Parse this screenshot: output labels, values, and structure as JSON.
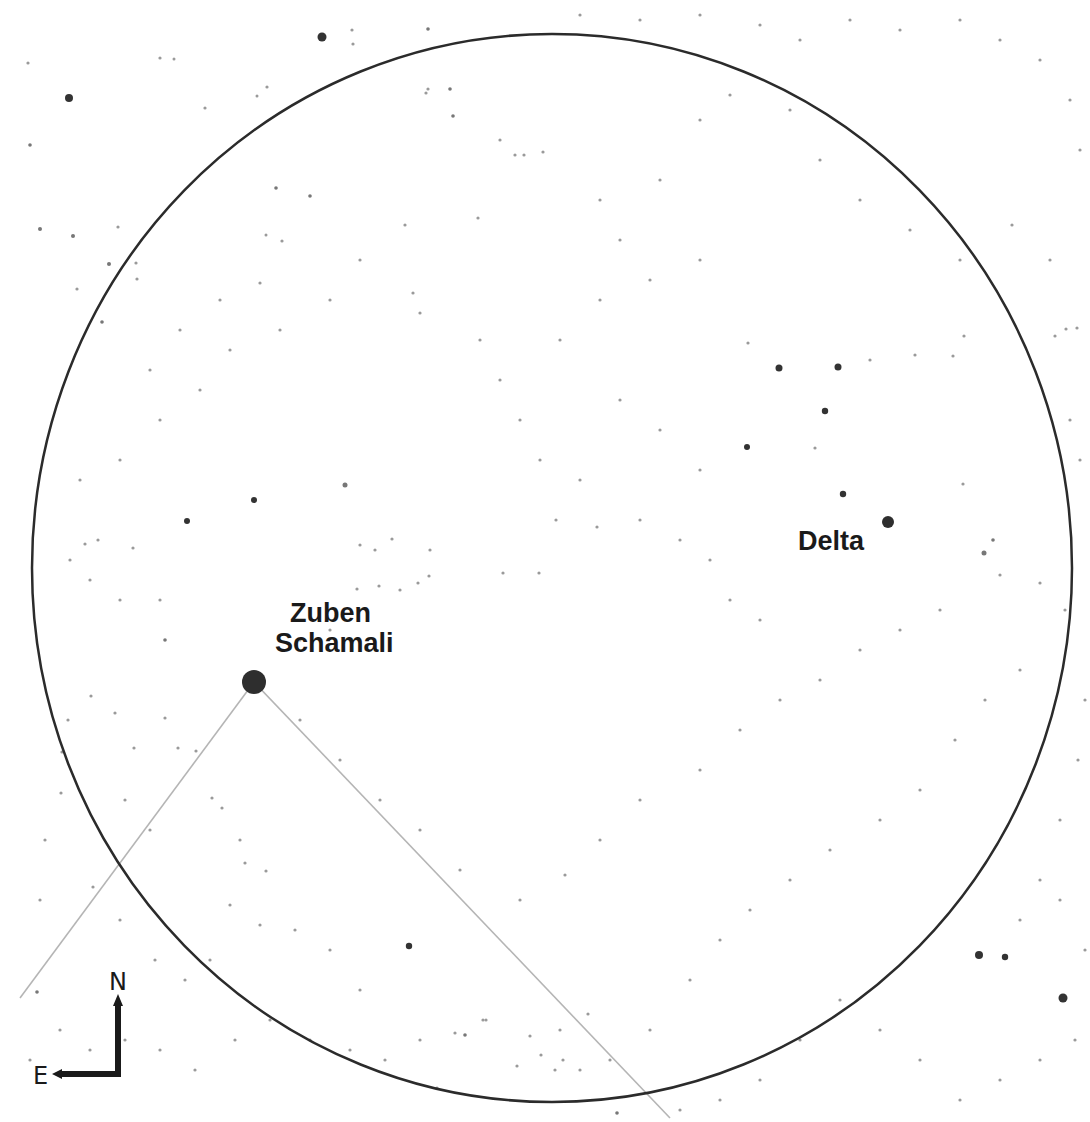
{
  "chart": {
    "background": "#ffffff",
    "field_of_view": {
      "cx": 552,
      "cy": 568,
      "rx": 520,
      "ry": 534,
      "stroke": "#2b2b2b",
      "stroke_width": 2.5
    },
    "asterism_lines": [
      {
        "x1": 254,
        "y1": 682,
        "x2": 20,
        "y2": 998
      },
      {
        "x1": 254,
        "y1": 682,
        "x2": 670,
        "y2": 1118
      }
    ],
    "line_color": "#b5b5b5"
  },
  "labels": {
    "zuben_line1": "Zuben",
    "zuben_line2": "Schamali",
    "delta": "Delta"
  },
  "compass": {
    "north": "N",
    "east": "E"
  },
  "named_stars": [
    {
      "name": "Zuben Schamali",
      "x": 254,
      "y": 682,
      "r": 12
    },
    {
      "name": "Delta",
      "x": 888,
      "y": 522,
      "r": 6
    }
  ],
  "stars": [
    [
      322,
      37,
      4.5
    ],
    [
      69,
      98,
      4
    ],
    [
      779,
      368,
      3.5
    ],
    [
      838,
      367,
      3.5
    ],
    [
      825,
      411,
      3.2
    ],
    [
      747,
      447,
      3
    ],
    [
      843,
      494,
      3.2
    ],
    [
      984,
      553,
      2.5
    ],
    [
      979,
      955,
      4
    ],
    [
      1005,
      957,
      3.2
    ],
    [
      1063,
      998,
      4.5
    ],
    [
      187,
      521,
      3
    ],
    [
      254,
      500,
      3
    ],
    [
      345,
      485,
      2.5
    ],
    [
      409,
      946,
      3.2
    ],
    [
      40,
      229,
      2
    ],
    [
      73,
      236,
      2
    ],
    [
      109,
      264,
      2
    ],
    [
      102,
      322,
      1.8
    ],
    [
      30,
      145,
      1.8
    ],
    [
      28,
      63,
      1.6
    ],
    [
      160,
      58,
      1.6
    ],
    [
      353,
      44,
      1.6
    ],
    [
      426,
      93,
      1.6
    ],
    [
      174,
      59,
      1.5
    ],
    [
      267,
      87,
      1.6
    ],
    [
      205,
      108,
      1.6
    ],
    [
      257,
      96,
      1.5
    ],
    [
      450,
      89,
      1.8
    ],
    [
      428,
      29,
      1.8
    ],
    [
      352,
      30,
      1.6
    ],
    [
      478,
      218,
      1.6
    ],
    [
      276,
      188,
      1.8
    ],
    [
      310,
      196,
      1.8
    ],
    [
      266,
      235,
      1.5
    ],
    [
      282,
      241,
      1.6
    ],
    [
      405,
      225,
      1.6
    ],
    [
      413,
      293,
      1.6
    ],
    [
      524,
      155,
      1.6
    ],
    [
      453,
      116,
      1.8
    ],
    [
      428,
      89,
      1.6
    ],
    [
      543,
      152,
      1.6
    ],
    [
      500,
      140,
      1.6
    ],
    [
      515,
      155,
      1.6
    ],
    [
      118,
      227,
      1.6
    ],
    [
      77,
      289,
      1.6
    ],
    [
      137,
      279,
      1.6
    ],
    [
      136,
      263,
      1.6
    ],
    [
      260,
      283,
      1.6
    ],
    [
      420,
      313,
      1.6
    ],
    [
      600,
      200,
      1.6
    ],
    [
      620,
      240,
      1.6
    ],
    [
      660,
      180,
      1.6
    ],
    [
      700,
      120,
      1.6
    ],
    [
      730,
      95,
      1.6
    ],
    [
      790,
      110,
      1.6
    ],
    [
      820,
      160,
      1.6
    ],
    [
      860,
      200,
      1.6
    ],
    [
      910,
      230,
      1.6
    ],
    [
      960,
      260,
      1.6
    ],
    [
      1012,
      225,
      1.6
    ],
    [
      1050,
      260,
      1.6
    ],
    [
      1066,
      329,
      1.6
    ],
    [
      1055,
      336,
      1.6
    ],
    [
      1077,
      328,
      1.6
    ],
    [
      964,
      336,
      1.6
    ],
    [
      953,
      356,
      1.6
    ],
    [
      915,
      355,
      1.6
    ],
    [
      748,
      343,
      1.6
    ],
    [
      870,
      360,
      1.6
    ],
    [
      815,
      448,
      1.6
    ],
    [
      963,
      484,
      1.6
    ],
    [
      993,
      540,
      1.8
    ],
    [
      1000,
      575,
      1.6
    ],
    [
      1040,
      583,
      1.6
    ],
    [
      1065,
      610,
      1.6
    ],
    [
      1020,
      670,
      1.6
    ],
    [
      985,
      700,
      1.6
    ],
    [
      955,
      740,
      1.6
    ],
    [
      920,
      790,
      1.6
    ],
    [
      880,
      820,
      1.6
    ],
    [
      830,
      850,
      1.6
    ],
    [
      790,
      880,
      1.6
    ],
    [
      750,
      910,
      1.6
    ],
    [
      720,
      940,
      1.6
    ],
    [
      690,
      980,
      1.6
    ],
    [
      650,
      1030,
      1.6
    ],
    [
      610,
      1060,
      1.6
    ],
    [
      580,
      1070,
      1.6
    ],
    [
      560,
      1030,
      1.6
    ],
    [
      530,
      1036,
      1.6
    ],
    [
      486,
      1020,
      1.6
    ],
    [
      455,
      1033,
      1.6
    ],
    [
      420,
      1040,
      1.6
    ],
    [
      385,
      1060,
      1.6
    ],
    [
      350,
      1050,
      1.6
    ],
    [
      310,
      1040,
      1.6
    ],
    [
      270,
      1020,
      1.6
    ],
    [
      235,
      1040,
      1.6
    ],
    [
      195,
      1070,
      1.6
    ],
    [
      160,
      1050,
      1.6
    ],
    [
      125,
      1040,
      1.6
    ],
    [
      90,
      1050,
      1.6
    ],
    [
      60,
      1030,
      1.6
    ],
    [
      37,
      992,
      1.8
    ],
    [
      30,
      1060,
      1.6
    ],
    [
      40,
      900,
      1.6
    ],
    [
      45,
      840,
      1.6
    ],
    [
      61,
      793,
      1.6
    ],
    [
      62,
      752,
      1.6
    ],
    [
      68,
      720,
      1.6
    ],
    [
      91,
      696,
      1.6
    ],
    [
      115,
      713,
      1.6
    ],
    [
      134,
      748,
      1.6
    ],
    [
      165,
      718,
      1.6
    ],
    [
      178,
      748,
      1.6
    ],
    [
      196,
      751,
      1.6
    ],
    [
      212,
      798,
      1.6
    ],
    [
      222,
      808,
      1.6
    ],
    [
      245,
      863,
      1.6
    ],
    [
      266,
      871,
      1.6
    ],
    [
      240,
      840,
      1.6
    ],
    [
      150,
      830,
      1.6
    ],
    [
      125,
      800,
      1.6
    ],
    [
      93,
      887,
      1.6
    ],
    [
      120,
      920,
      1.6
    ],
    [
      155,
      960,
      1.6
    ],
    [
      185,
      980,
      1.6
    ],
    [
      210,
      960,
      1.6
    ],
    [
      230,
      905,
      1.6
    ],
    [
      260,
      925,
      1.6
    ],
    [
      295,
      930,
      1.6
    ],
    [
      330,
      950,
      1.6
    ],
    [
      360,
      990,
      1.6
    ],
    [
      300,
      720,
      1.6
    ],
    [
      340,
      760,
      1.6
    ],
    [
      380,
      800,
      1.6
    ],
    [
      420,
      830,
      1.6
    ],
    [
      460,
      870,
      1.6
    ],
    [
      520,
      900,
      1.6
    ],
    [
      565,
      875,
      1.6
    ],
    [
      600,
      840,
      1.6
    ],
    [
      640,
      800,
      1.6
    ],
    [
      700,
      770,
      1.6
    ],
    [
      740,
      730,
      1.6
    ],
    [
      780,
      700,
      1.6
    ],
    [
      820,
      680,
      1.6
    ],
    [
      860,
      650,
      1.6
    ],
    [
      900,
      630,
      1.6
    ],
    [
      940,
      610,
      1.6
    ],
    [
      300,
      640,
      1.6
    ],
    [
      330,
      630,
      1.6
    ],
    [
      360,
      610,
      1.6
    ],
    [
      400,
      590,
      1.6
    ],
    [
      430,
      550,
      1.6
    ],
    [
      360,
      545,
      1.6
    ],
    [
      375,
      550,
      1.6
    ],
    [
      392,
      539,
      1.6
    ],
    [
      379,
      586,
      1.6
    ],
    [
      429,
      576,
      1.6
    ],
    [
      357,
      589,
      1.6
    ],
    [
      418,
      583,
      1.6
    ],
    [
      503,
      573,
      1.6
    ],
    [
      539,
      573,
      1.6
    ],
    [
      556,
      520,
      1.6
    ],
    [
      597,
      527,
      1.6
    ],
    [
      640,
      520,
      1.6
    ],
    [
      680,
      540,
      1.6
    ],
    [
      710,
      560,
      1.6
    ],
    [
      730,
      600,
      1.6
    ],
    [
      760,
      620,
      1.6
    ],
    [
      540,
      460,
      1.6
    ],
    [
      520,
      420,
      1.6
    ],
    [
      500,
      380,
      1.6
    ],
    [
      480,
      340,
      1.6
    ],
    [
      560,
      340,
      1.6
    ],
    [
      600,
      300,
      1.6
    ],
    [
      650,
      280,
      1.6
    ],
    [
      700,
      260,
      1.6
    ],
    [
      620,
      400,
      1.6
    ],
    [
      660,
      430,
      1.6
    ],
    [
      700,
      470,
      1.6
    ],
    [
      580,
      480,
      1.6
    ],
    [
      165,
      640,
      1.8
    ],
    [
      160,
      600,
      1.6
    ],
    [
      120,
      600,
      1.6
    ],
    [
      90,
      580,
      1.6
    ],
    [
      70,
      560,
      1.6
    ],
    [
      80,
      480,
      1.6
    ],
    [
      120,
      460,
      1.6
    ],
    [
      160,
      420,
      1.6
    ],
    [
      200,
      390,
      1.6
    ],
    [
      230,
      350,
      1.6
    ],
    [
      280,
      330,
      1.6
    ],
    [
      330,
      300,
      1.6
    ],
    [
      360,
      260,
      1.6
    ],
    [
      150,
      370,
      1.6
    ],
    [
      180,
      330,
      1.6
    ],
    [
      220,
      300,
      1.6
    ],
    [
      133,
      548,
      1.6
    ],
    [
      85,
      544,
      1.6
    ],
    [
      98,
      540,
      1.6
    ],
    [
      1080,
      460,
      1.6
    ],
    [
      1070,
      420,
      1.6
    ],
    [
      1080,
      150,
      1.6
    ],
    [
      1070,
      100,
      1.6
    ],
    [
      1040,
      60,
      1.6
    ],
    [
      1000,
      40,
      1.6
    ],
    [
      960,
      20,
      1.6
    ],
    [
      900,
      30,
      1.6
    ],
    [
      850,
      20,
      1.6
    ],
    [
      800,
      40,
      1.6
    ],
    [
      760,
      25,
      1.6
    ],
    [
      700,
      15,
      1.6
    ],
    [
      640,
      20,
      1.6
    ],
    [
      580,
      15,
      1.6
    ],
    [
      1085,
      700,
      1.6
    ],
    [
      1078,
      760,
      1.6
    ],
    [
      1060,
      820,
      1.6
    ],
    [
      1040,
      880,
      1.6
    ],
    [
      1020,
      920,
      1.6
    ],
    [
      1060,
      900,
      1.6
    ],
    [
      1085,
      950,
      1.6
    ],
    [
      1075,
      1040,
      1.6
    ],
    [
      1040,
      1060,
      1.6
    ],
    [
      1000,
      1080,
      1.6
    ],
    [
      960,
      1100,
      1.6
    ],
    [
      920,
      1060,
      1.6
    ],
    [
      880,
      1030,
      1.6
    ],
    [
      840,
      1000,
      1.6
    ],
    [
      800,
      1040,
      1.6
    ],
    [
      760,
      1080,
      1.6
    ],
    [
      720,
      1100,
      1.6
    ],
    [
      680,
      1110,
      1.6
    ],
    [
      617,
      1113,
      1.8
    ],
    [
      563,
      1060,
      1.6
    ],
    [
      465,
      1035,
      1.8
    ],
    [
      483,
      1020,
      1.6
    ],
    [
      517,
      1066,
      1.6
    ],
    [
      541,
      1055,
      1.6
    ],
    [
      555,
      1070,
      1.6
    ],
    [
      588,
      1014,
      1.6
    ],
    [
      437,
      1088,
      1.6
    ]
  ]
}
